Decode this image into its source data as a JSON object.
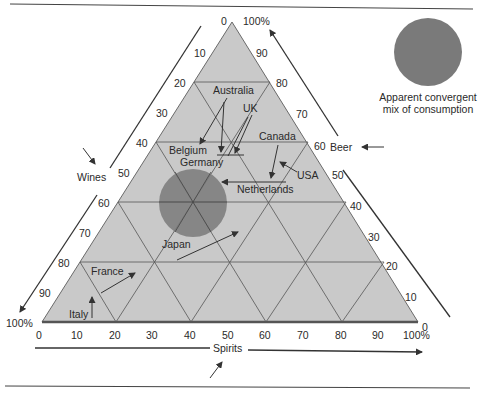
{
  "diagram": {
    "type": "ternary",
    "axes": {
      "wines": {
        "label": "Wines",
        "ticks": [
          "10",
          "20",
          "30",
          "40",
          "50",
          "60",
          "70",
          "80",
          "90",
          "100%"
        ]
      },
      "beer": {
        "label": "Beer",
        "ticks": [
          "100%",
          "90",
          "80",
          "70",
          "60",
          "50",
          "40",
          "30",
          "20",
          "10",
          "0"
        ]
      },
      "spirits": {
        "label": "Spirits",
        "ticks": [
          "0",
          "10",
          "20",
          "30",
          "40",
          "50",
          "60",
          "70",
          "80",
          "90",
          "100%"
        ]
      },
      "apex_top_zero": "0",
      "left_corner": "100%",
      "right_corner_zero": "0"
    },
    "countries": [
      {
        "name": "Australia"
      },
      {
        "name": "UK"
      },
      {
        "name": "Canada"
      },
      {
        "name": "Belgium"
      },
      {
        "name": "Germany"
      },
      {
        "name": "USA"
      },
      {
        "name": "Netherlands"
      },
      {
        "name": "Japan"
      },
      {
        "name": "France"
      },
      {
        "name": "Italy"
      }
    ],
    "legend": {
      "line1": "Apparent convergent",
      "line2": "mix of consumption"
    },
    "colors": {
      "triangle_fill": "#c9c9c9",
      "grid_line": "#555555",
      "circle_fill": "#7a7a7a",
      "text": "#2a2a2a"
    }
  }
}
